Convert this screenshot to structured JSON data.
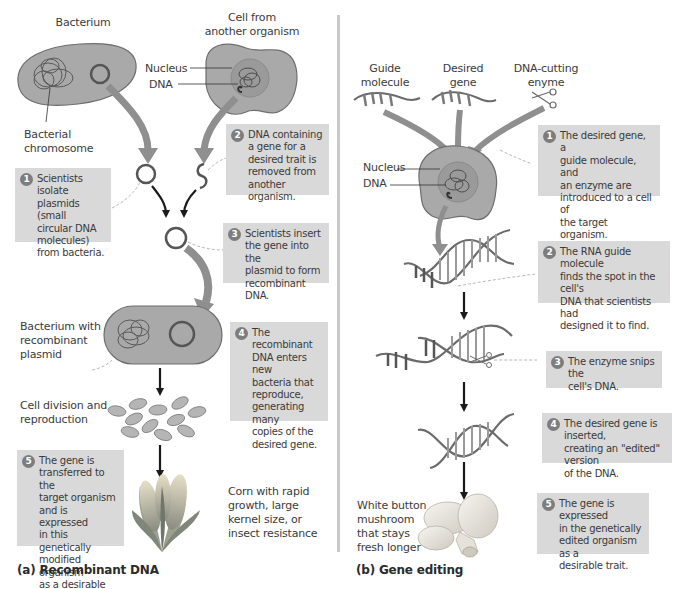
{
  "panel_a": {
    "caption": "(a) Recombinant DNA",
    "labels": {
      "bacterium": "Bacterium",
      "cell_from_line1": "Cell from",
      "cell_from_line2": "another organism",
      "nucleus": "Nucleus",
      "dna": "DNA",
      "bacterial_chromosome_line1": "Bacterial",
      "bacterial_chromosome_line2": "chromosome",
      "bacterium_with_line1": "Bacterium with",
      "bacterium_with_line2": "recombinant",
      "bacterium_with_line3": "plasmid",
      "cell_division_line1": "Cell division and",
      "cell_division_line2": "reproduction",
      "corn_line1": "Corn with rapid",
      "corn_line2": "growth, large",
      "corn_line3": "kernel size, or",
      "corn_line4": "insect resistance"
    },
    "steps": [
      {
        "number": "1",
        "lines": [
          "Scientists isolate",
          "plasmids (small",
          "circular DNA",
          "molecules)",
          "from bacteria."
        ]
      },
      {
        "number": "2",
        "lines": [
          "DNA containing",
          "a gene for a",
          "desired trait is",
          "removed from",
          "another organism."
        ]
      },
      {
        "number": "3",
        "lines": [
          "Scientists insert",
          "the gene into the",
          "plasmid to form",
          "recombinant DNA."
        ]
      },
      {
        "number": "4",
        "lines": [
          "The recombinant",
          "DNA enters new",
          "bacteria that",
          "reproduce,",
          "generating many",
          "copies of the",
          "desired gene."
        ]
      },
      {
        "number": "5",
        "lines": [
          "The gene is",
          "transferred to the",
          "target organism",
          "and is expressed",
          "in this genetically",
          "modified organism",
          "as a desirable trait."
        ]
      }
    ]
  },
  "panel_b": {
    "caption": "(b) Gene editing",
    "labels": {
      "guide_line1": "Guide",
      "guide_line2": "molecule",
      "desired_line1": "Desired",
      "desired_line2": "gene",
      "cutting_line1": "DNA-cutting",
      "cutting_line2": "enyme",
      "nucleus": "Nucleus",
      "dna": "DNA",
      "mushroom_line1": "White button",
      "mushroom_line2": "mushroom",
      "mushroom_line3": "that stays",
      "mushroom_line4": "fresh longer"
    },
    "steps": [
      {
        "number": "1",
        "lines": [
          "The desired gene, a",
          "guide molecule, and",
          "an enzyme are",
          "introduced to a cell of",
          "the target organism."
        ]
      },
      {
        "number": "2",
        "lines": [
          "The RNA guide molecule",
          "finds the spot in the cell's",
          "DNA that scientists had",
          "designed it to find."
        ]
      },
      {
        "number": "3",
        "lines": [
          "The enzyme snips the",
          "cell's DNA."
        ]
      },
      {
        "number": "4",
        "lines": [
          "The desired gene is inserted,",
          "creating an \"edited\" version",
          "of the DNA."
        ]
      },
      {
        "number": "5",
        "lines": [
          "The gene is expressed",
          "in the genetically",
          "edited organism as a",
          "desirable trait."
        ]
      }
    ]
  },
  "colors": {
    "cell_fill": "#a9a9a9",
    "cell_stroke": "#6e6e6e",
    "box_fill": "#d9d9d9",
    "badge": "#7d7d7d",
    "arrow_gray": "#8f8f8f",
    "divider": "#c8c8c8"
  }
}
